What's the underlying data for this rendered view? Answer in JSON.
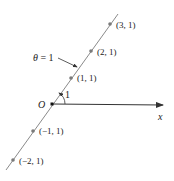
{
  "diagram": {
    "title": "",
    "line_label": "θ = 1",
    "origin_label": "O",
    "axis_label": "x",
    "angle_label": "1",
    "points": [
      {
        "label": "(3, 1)",
        "x": 110,
        "y": 24
      },
      {
        "label": "(2, 1)",
        "x": 91,
        "y": 51
      },
      {
        "label": "(1, 1)",
        "x": 71,
        "y": 78
      },
      {
        "label": "(−1, 1)",
        "x": 33,
        "y": 131
      },
      {
        "label": "(−2, 1)",
        "x": 13,
        "y": 160
      }
    ],
    "colors": {
      "line": "#8a8a8a",
      "point": "#7a7a7a",
      "axis": "#333333",
      "text": "#222222"
    }
  }
}
